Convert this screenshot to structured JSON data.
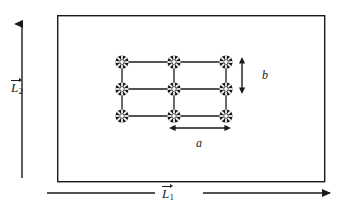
{
  "figure": {
    "background_color": "#ffffff",
    "line_color": "#1a1a1a",
    "atom_color": "#1a1a1a",
    "atom_highlight_color": "#ffffff"
  },
  "box": {
    "name": "outer-boundary-rectangle",
    "x": 57,
    "y": 15,
    "width": 268,
    "height": 167,
    "stroke_width": 1.4
  },
  "lattice": {
    "name": "atomic-lattice",
    "rows": 3,
    "columns": 3,
    "origin_x": 122,
    "origin_y": 62,
    "spacing_a": 52,
    "spacing_b": 27,
    "atom_radius": 6.6,
    "atom_count": 9,
    "bond_stroke_width": 1.3,
    "atoms": [
      {
        "label": "atom-r1-c1",
        "x": 122,
        "y": 62
      },
      {
        "label": "atom-r1-c2",
        "x": 174,
        "y": 62
      },
      {
        "label": "atom-r1-c3",
        "x": 226,
        "y": 62
      },
      {
        "label": "atom-r2-c1",
        "x": 122,
        "y": 89
      },
      {
        "label": "atom-r2-c2",
        "x": 174,
        "y": 89
      },
      {
        "label": "atom-r2-c3",
        "x": 226,
        "y": 89
      },
      {
        "label": "atom-r3-c1",
        "x": 122,
        "y": 116
      },
      {
        "label": "atom-r3-c2",
        "x": 174,
        "y": 116
      },
      {
        "label": "atom-r3-c3",
        "x": 226,
        "y": 116
      }
    ]
  },
  "vectors": {
    "L2": {
      "name": "vector-L2",
      "symbol": "L",
      "subscript": "2",
      "direction": "up",
      "axis": "vertical",
      "x": 22,
      "y_start": 178,
      "y_end": 16
    },
    "L1": {
      "name": "vector-L1",
      "symbol": "L",
      "subscript": "1",
      "direction": "right",
      "axis": "horizontal",
      "y": 193,
      "left_segment_start": 47,
      "left_segment_end": 155,
      "right_segment_start": 203,
      "right_segment_end": 330
    }
  },
  "dimensions": {
    "a": {
      "name": "lattice-constant-a",
      "label": "a",
      "axis": "horizontal",
      "y": 128,
      "x_start": 174,
      "x_end": 226
    },
    "b": {
      "name": "lattice-constant-b",
      "label": "b",
      "axis": "vertical",
      "x": 242,
      "y_start": 62,
      "y_end": 89
    }
  }
}
